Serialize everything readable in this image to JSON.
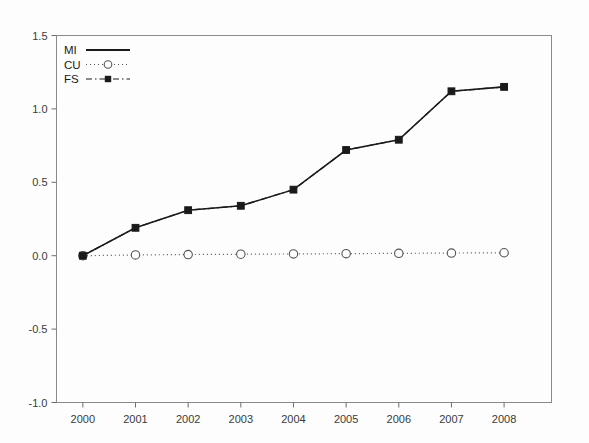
{
  "chart_data": {
    "type": "line",
    "title": "",
    "xlabel": "",
    "ylabel": "",
    "categories": [
      "2000",
      "2001",
      "2002",
      "2003",
      "2004",
      "2005",
      "2006",
      "2007",
      "2008"
    ],
    "x": [
      2000,
      2001,
      2002,
      2003,
      2004,
      2005,
      2006,
      2007,
      2008
    ],
    "xlim": [
      1999.5,
      2008.9
    ],
    "ylim": [
      -1.0,
      1.5
    ],
    "yticks": [
      -1.0,
      -0.5,
      0.0,
      0.5,
      1.0,
      1.5
    ],
    "ytick_labels": [
      "-1.0",
      "-0.5",
      "0.0",
      "0.5",
      "1.0",
      "1.5"
    ],
    "xtick_labels": [
      "2000",
      "2001",
      "2002",
      "2003",
      "2004",
      "2005",
      "2006",
      "2007",
      "2008"
    ],
    "grid": false,
    "legend_position": "top-left",
    "series": [
      {
        "name": "MI",
        "style": "solid",
        "marker": "none",
        "color": "#1a1a1a",
        "values": [
          0.0,
          0.19,
          0.31,
          0.34,
          0.45,
          0.72,
          0.79,
          1.12,
          1.15
        ]
      },
      {
        "name": "CU",
        "style": "dotted",
        "marker": "open-circle",
        "color": "#555555",
        "values": [
          0.0,
          0.005,
          0.008,
          0.01,
          0.012,
          0.014,
          0.016,
          0.018,
          0.02
        ]
      },
      {
        "name": "FS",
        "style": "dashdot",
        "marker": "filled-square",
        "color": "#1a1a1a",
        "values": [
          0.0,
          0.19,
          0.31,
          0.34,
          0.45,
          0.72,
          0.79,
          1.12,
          1.15
        ]
      }
    ]
  },
  "legend": {
    "entries": [
      {
        "label": "MI"
      },
      {
        "label": "CU"
      },
      {
        "label": "FS"
      }
    ]
  }
}
